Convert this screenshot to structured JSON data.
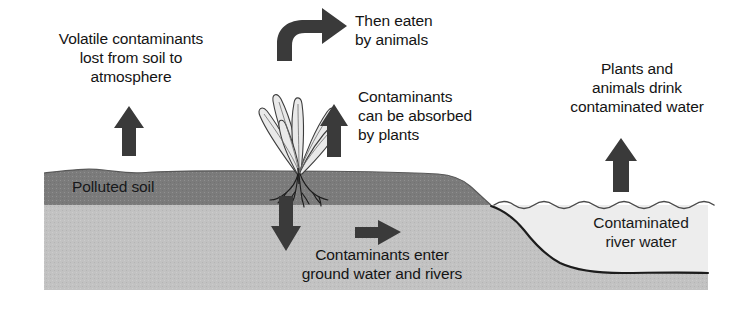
{
  "diagram": {
    "background": "#ffffff"
  },
  "colors": {
    "polluted_soil": "#7b7b7b",
    "subsoil": "#c2c2c2",
    "river_water": "#ebebeb",
    "arrow": "#3a3a3a",
    "outline": "#1c1c1c",
    "text": "#141414"
  },
  "labels": {
    "volatile": "Volatile contaminants\nlost from soil to\natmosphere",
    "eaten": "Then eaten\nby animals",
    "absorbed": "Contaminants\ncan be absorbed\nby plants",
    "drink": "Plants and\nanimals drink\ncontaminated water",
    "polluted_soil": "Polluted soil",
    "ground_water": "Contaminants enter\nground water and rivers",
    "river": "Contaminated\nriver water"
  },
  "arrows": [
    {
      "name": "arrow-volatile-up",
      "direction": "up",
      "meaning": "Volatile contaminants lost from soil to atmosphere"
    },
    {
      "name": "arrow-eaten-curved",
      "direction": "curve-right",
      "meaning": "Then eaten by animals"
    },
    {
      "name": "arrow-absorbed-up",
      "direction": "up",
      "meaning": "Contaminants can be absorbed by plants"
    },
    {
      "name": "arrow-drink-up",
      "direction": "up",
      "meaning": "Plants and animals drink contaminated water"
    },
    {
      "name": "arrow-leach-down",
      "direction": "down",
      "meaning": "Contaminants enter ground water"
    },
    {
      "name": "arrow-flow-right",
      "direction": "right",
      "meaning": "Ground water flows to rivers"
    }
  ],
  "layers": [
    {
      "name": "polluted-soil-layer",
      "label": "Polluted soil"
    },
    {
      "name": "subsoil-layer",
      "label": ""
    },
    {
      "name": "river-water-layer",
      "label": "Contaminated river water"
    }
  ],
  "plant": {
    "name": "plant-with-roots",
    "parts": [
      "leaves",
      "stem",
      "roots"
    ]
  }
}
